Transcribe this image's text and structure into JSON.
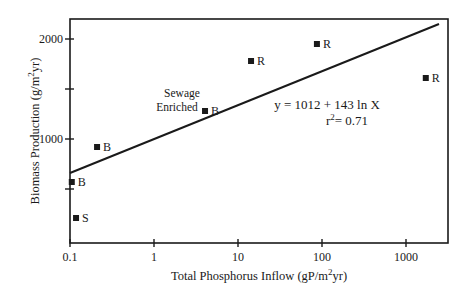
{
  "chart_data": {
    "type": "scatter",
    "title": "",
    "xlabel": "Total Phosphorus Inflow (gP/m2yr)",
    "ylabel": "Biomass Production (g/m2yr)",
    "xscale": "log",
    "xlim": [
      0.1,
      2700
    ],
    "ylim": [
      -40,
      2200
    ],
    "grid": false,
    "legend": null,
    "x_ticks": [
      0.1,
      1,
      10,
      100,
      1000
    ],
    "x_tick_labels": [
      "0.1",
      "1",
      "10",
      "100",
      "1000"
    ],
    "y_ticks": [
      500,
      1000,
      1500,
      2000
    ],
    "y_tick_labels": [
      "",
      "1000",
      "",
      "2000"
    ],
    "series": [
      {
        "name": "sites",
        "marker": "square",
        "points": [
          {
            "x": 0.118,
            "y": 210,
            "label": "S"
          },
          {
            "x": 0.105,
            "y": 570,
            "label": "B"
          },
          {
            "x": 0.21,
            "y": 920,
            "label": "B"
          },
          {
            "x": 4.05,
            "y": 1280,
            "label": "B",
            "annotation": "Sewage Enriched"
          },
          {
            "x": 14.3,
            "y": 1780,
            "label": "R"
          },
          {
            "x": 87,
            "y": 1950,
            "label": "R"
          },
          {
            "x": 1720,
            "y": 1610,
            "label": "R"
          }
        ]
      }
    ],
    "regression": {
      "equation": "y = 1012 + 143 ln X",
      "r_squared": "r2= 0.71",
      "x_start": 0.1,
      "y_start": 660,
      "x_end": 2470,
      "y_end": 2150
    },
    "annotations": [
      "Sewage",
      "Enriched"
    ]
  },
  "labels": {
    "xlabel_main": "Total Phosphorus Inflow (gP/m",
    "xlabel_sup": "2",
    "xlabel_end": "yr)",
    "ylabel_main": "Biomass Production (g/m",
    "ylabel_sup": "2",
    "ylabel_end": "yr)",
    "eq_line1": "y = 1012 + 143 ln X",
    "eq_r": "r",
    "eq_sup": "2",
    "eq_val": "= 0.71",
    "sewage": "Sewage",
    "enriched": "Enriched"
  }
}
